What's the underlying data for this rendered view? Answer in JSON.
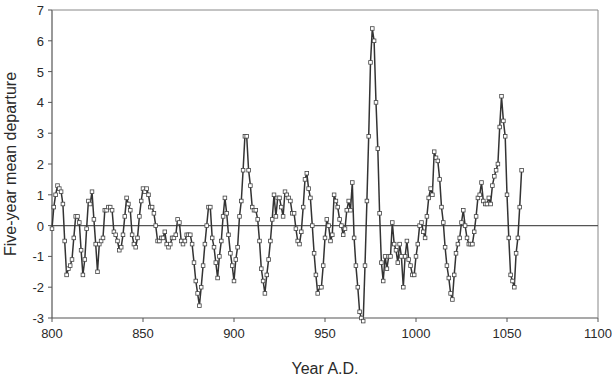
{
  "chart_data": {
    "type": "line",
    "title": "",
    "xlabel": "Year A.D.",
    "ylabel": "Five-year mean departure",
    "xlim": [
      800,
      1100
    ],
    "ylim": [
      -3,
      7
    ],
    "xticks": [
      800,
      850,
      900,
      950,
      1000,
      1050,
      1100
    ],
    "yticks": [
      -3,
      -2,
      -1,
      0,
      1,
      2,
      3,
      4,
      5,
      6,
      7
    ],
    "grid": false,
    "legend": null,
    "reference_line": 0,
    "marker": "open-square",
    "colors": {
      "line": "#333333",
      "axis": "#555555",
      "zero_line": "#555555"
    },
    "series": [
      {
        "name": "Five-year mean departure",
        "points": [
          [
            800,
            -0.1
          ],
          [
            801,
            0.6
          ],
          [
            802,
            1.0
          ],
          [
            803,
            1.3
          ],
          [
            804,
            1.2
          ],
          [
            805,
            1.1
          ],
          [
            806,
            0.7
          ],
          [
            807,
            -0.5
          ],
          [
            808,
            -1.6
          ],
          [
            809,
            -1.4
          ],
          [
            810,
            -1.3
          ],
          [
            811,
            -1.1
          ],
          [
            812,
            -0.4
          ],
          [
            813,
            0.3
          ],
          [
            814,
            0.3
          ],
          [
            815,
            0.1
          ],
          [
            816,
            -0.8
          ],
          [
            817,
            -1.6
          ],
          [
            818,
            -1.1
          ],
          [
            819,
            -0.1
          ],
          [
            820,
            0.8
          ],
          [
            821,
            0.7
          ],
          [
            822,
            1.1
          ],
          [
            823,
            0.2
          ],
          [
            824,
            -0.6
          ],
          [
            825,
            -1.5
          ],
          [
            826,
            -0.6
          ],
          [
            827,
            -0.5
          ],
          [
            828,
            -0.4
          ],
          [
            829,
            0.5
          ],
          [
            830,
            0.5
          ],
          [
            831,
            0.6
          ],
          [
            832,
            0.6
          ],
          [
            833,
            0.5
          ],
          [
            834,
            -0.2
          ],
          [
            835,
            -0.3
          ],
          [
            836,
            -0.5
          ],
          [
            837,
            -0.8
          ],
          [
            838,
            -0.7
          ],
          [
            839,
            -0.3
          ],
          [
            840,
            0.3
          ],
          [
            841,
            0.9
          ],
          [
            842,
            0.7
          ],
          [
            843,
            0.5
          ],
          [
            844,
            -0.3
          ],
          [
            845,
            -0.6
          ],
          [
            846,
            -0.7
          ],
          [
            847,
            -0.4
          ],
          [
            848,
            0.3
          ],
          [
            849,
            0.8
          ],
          [
            850,
            1.2
          ],
          [
            851,
            1.1
          ],
          [
            852,
            1.2
          ],
          [
            853,
            1.0
          ],
          [
            854,
            0.6
          ],
          [
            855,
            0.6
          ],
          [
            856,
            0.4
          ],
          [
            857,
            0.0
          ],
          [
            858,
            -0.5
          ],
          [
            859,
            -0.5
          ],
          [
            860,
            -0.4
          ],
          [
            861,
            -0.4
          ],
          [
            862,
            -0.2
          ],
          [
            863,
            -0.6
          ],
          [
            864,
            -0.7
          ],
          [
            865,
            -0.6
          ],
          [
            866,
            -0.4
          ],
          [
            867,
            -0.4
          ],
          [
            868,
            -0.3
          ],
          [
            869,
            0.2
          ],
          [
            870,
            0.1
          ],
          [
            871,
            -0.5
          ],
          [
            872,
            -0.6
          ],
          [
            873,
            -0.5
          ],
          [
            874,
            -0.3
          ],
          [
            875,
            -0.3
          ],
          [
            876,
            -0.3
          ],
          [
            877,
            -0.6
          ],
          [
            878,
            -1.2
          ],
          [
            879,
            -1.8
          ],
          [
            880,
            -2.2
          ],
          [
            881,
            -2.6
          ],
          [
            882,
            -2.0
          ],
          [
            883,
            -1.3
          ],
          [
            884,
            -0.6
          ],
          [
            885,
            0.0
          ],
          [
            886,
            0.6
          ],
          [
            887,
            0.6
          ],
          [
            888,
            -0.4
          ],
          [
            889,
            -0.7
          ],
          [
            890,
            -1.2
          ],
          [
            891,
            -1.7
          ],
          [
            892,
            -1.0
          ],
          [
            893,
            -0.5
          ],
          [
            894,
            0.3
          ],
          [
            895,
            0.9
          ],
          [
            896,
            0.4
          ],
          [
            897,
            -0.3
          ],
          [
            898,
            -0.9
          ],
          [
            899,
            -1.3
          ],
          [
            900,
            -1.8
          ],
          [
            901,
            -1.1
          ],
          [
            902,
            -0.7
          ],
          [
            903,
            0.3
          ],
          [
            904,
            0.8
          ],
          [
            905,
            1.8
          ],
          [
            906,
            2.9
          ],
          [
            907,
            2.9
          ],
          [
            908,
            1.8
          ],
          [
            909,
            1.3
          ],
          [
            910,
            0.6
          ],
          [
            911,
            0.5
          ],
          [
            912,
            0.5
          ],
          [
            913,
            0.2
          ],
          [
            914,
            -0.5
          ],
          [
            915,
            -1.4
          ],
          [
            916,
            -1.8
          ],
          [
            917,
            -2.2
          ],
          [
            918,
            -1.6
          ],
          [
            919,
            -1.1
          ],
          [
            920,
            -0.5
          ],
          [
            921,
            0.2
          ],
          [
            922,
            1.0
          ],
          [
            923,
            0.3
          ],
          [
            924,
            0.9
          ],
          [
            925,
            0.9
          ],
          [
            926,
            0.6
          ],
          [
            927,
            0.3
          ],
          [
            928,
            1.1
          ],
          [
            929,
            1.0
          ],
          [
            930,
            0.9
          ],
          [
            931,
            0.8
          ],
          [
            932,
            0.4
          ],
          [
            933,
            0.4
          ],
          [
            934,
            -0.1
          ],
          [
            935,
            -0.5
          ],
          [
            936,
            -0.6
          ],
          [
            937,
            -0.2
          ],
          [
            938,
            0.6
          ],
          [
            939,
            1.5
          ],
          [
            940,
            1.7
          ],
          [
            941,
            1.2
          ],
          [
            942,
            0.9
          ],
          [
            943,
            0.0
          ],
          [
            944,
            -0.9
          ],
          [
            945,
            -1.6
          ],
          [
            946,
            -2.2
          ],
          [
            947,
            -2.0
          ],
          [
            948,
            -2.0
          ],
          [
            949,
            -1.3
          ],
          [
            950,
            -0.4
          ],
          [
            951,
            0.2
          ],
          [
            952,
            0.0
          ],
          [
            953,
            -0.5
          ],
          [
            954,
            -0.3
          ],
          [
            955,
            1.0
          ],
          [
            956,
            0.8
          ],
          [
            957,
            0.6
          ],
          [
            958,
            0.2
          ],
          [
            959,
            0.0
          ],
          [
            960,
            -0.3
          ],
          [
            961,
            -0.1
          ],
          [
            962,
            0.5
          ],
          [
            963,
            0.8
          ],
          [
            964,
            0.5
          ],
          [
            965,
            1.4
          ],
          [
            966,
            -0.4
          ],
          [
            967,
            -1.3
          ],
          [
            968,
            -2.0
          ],
          [
            969,
            -2.8
          ],
          [
            970,
            -3.0
          ],
          [
            971,
            -3.1
          ],
          [
            972,
            -1.3
          ],
          [
            973,
            0.8
          ],
          [
            974,
            2.9
          ],
          [
            975,
            5.3
          ],
          [
            976,
            6.4
          ],
          [
            977,
            6.0
          ],
          [
            978,
            4.0
          ],
          [
            979,
            2.5
          ],
          [
            980,
            0.4
          ],
          [
            981,
            -1.2
          ],
          [
            982,
            -1.8
          ],
          [
            983,
            -1.0
          ],
          [
            984,
            -1.4
          ],
          [
            985,
            -1.0
          ],
          [
            986,
            -1.0
          ],
          [
            987,
            0.1
          ],
          [
            988,
            -0.6
          ],
          [
            989,
            -0.8
          ],
          [
            990,
            -1.2
          ],
          [
            991,
            -0.6
          ],
          [
            992,
            -1.0
          ],
          [
            993,
            -2.0
          ],
          [
            994,
            -1.0
          ],
          [
            995,
            -0.5
          ],
          [
            996,
            -1.1
          ],
          [
            997,
            -1.3
          ],
          [
            998,
            -1.6
          ],
          [
            999,
            -1.6
          ],
          [
            1000,
            -1.0
          ],
          [
            1001,
            -0.6
          ],
          [
            1002,
            0.0
          ],
          [
            1003,
            0.1
          ],
          [
            1004,
            -0.2
          ],
          [
            1005,
            -0.4
          ],
          [
            1006,
            0.3
          ],
          [
            1007,
            0.9
          ],
          [
            1008,
            1.2
          ],
          [
            1009,
            1.0
          ],
          [
            1010,
            2.4
          ],
          [
            1011,
            2.2
          ],
          [
            1012,
            2.1
          ],
          [
            1013,
            1.5
          ],
          [
            1014,
            0.6
          ],
          [
            1015,
            0.1
          ],
          [
            1016,
            -0.7
          ],
          [
            1017,
            -1.3
          ],
          [
            1018,
            -1.7
          ],
          [
            1019,
            -2.2
          ],
          [
            1020,
            -2.4
          ],
          [
            1021,
            -1.6
          ],
          [
            1022,
            -0.9
          ],
          [
            1023,
            -0.6
          ],
          [
            1024,
            -0.4
          ],
          [
            1025,
            0.1
          ],
          [
            1026,
            0.5
          ],
          [
            1027,
            0.0
          ],
          [
            1028,
            -0.4
          ],
          [
            1029,
            -0.6
          ],
          [
            1030,
            -0.6
          ],
          [
            1031,
            -0.6
          ],
          [
            1032,
            -0.2
          ],
          [
            1033,
            0.3
          ],
          [
            1034,
            0.9
          ],
          [
            1035,
            1.0
          ],
          [
            1036,
            1.4
          ],
          [
            1037,
            0.8
          ],
          [
            1038,
            0.7
          ],
          [
            1039,
            0.7
          ],
          [
            1040,
            0.9
          ],
          [
            1041,
            0.7
          ],
          [
            1042,
            1.3
          ],
          [
            1043,
            1.6
          ],
          [
            1044,
            1.8
          ],
          [
            1045,
            2.0
          ],
          [
            1046,
            3.2
          ],
          [
            1047,
            4.2
          ],
          [
            1048,
            3.4
          ],
          [
            1049,
            2.9
          ],
          [
            1050,
            1.0
          ],
          [
            1051,
            -0.4
          ],
          [
            1052,
            -1.6
          ],
          [
            1053,
            -1.8
          ],
          [
            1054,
            -2.0
          ],
          [
            1055,
            -0.9
          ],
          [
            1056,
            -0.4
          ],
          [
            1057,
            0.6
          ],
          [
            1058,
            1.8
          ]
        ]
      }
    ]
  },
  "axes": {
    "x_title": "Year A.D.",
    "y_title": "Five-year mean departure",
    "x_tick_labels": [
      "800",
      "850",
      "900",
      "950",
      "1000",
      "1050",
      "1100"
    ],
    "y_tick_labels": [
      "-3",
      "-2",
      "-1",
      "0",
      "1",
      "2",
      "3",
      "4",
      "5",
      "6",
      "7"
    ]
  }
}
